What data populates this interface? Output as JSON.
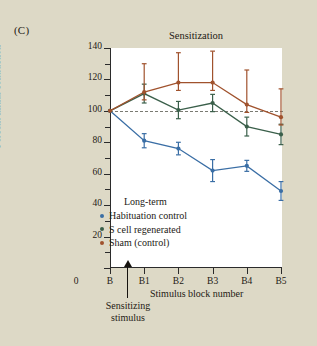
{
  "panel": {
    "label": "(C)"
  },
  "chart_data": {
    "type": "line",
    "title": "Sensitization",
    "xlabel": "Stimulus block number",
    "ylabel": "Percent initial contraction",
    "categories": [
      "B",
      "B1",
      "B2",
      "B3",
      "B4",
      "B5"
    ],
    "x_tick_labels": [
      "0",
      "B",
      "B1",
      "B2",
      "B3",
      "B4",
      "B5"
    ],
    "ylim": [
      0,
      140
    ],
    "y_ticks": [
      0,
      20,
      40,
      60,
      80,
      100,
      120,
      140
    ],
    "y_tick_labels": [
      "",
      "20",
      "40",
      "60",
      "80",
      "100",
      "120",
      "140"
    ],
    "y_minor_ticks": [
      10,
      30,
      50,
      70,
      90,
      110,
      130
    ],
    "grid": false,
    "reference_line": {
      "value": 100,
      "style": "dashed",
      "color": "#7a7a72"
    },
    "legend_position": "lower-left-inside",
    "legend_title": "Long-term",
    "annotation": {
      "text": "Sensitizing stimulus",
      "at_x": "between B and B1"
    },
    "series": [
      {
        "name": "Habituation control",
        "color": "#3a6ea5",
        "values": [
          100,
          81,
          76,
          62,
          65,
          49
        ],
        "err_low": [
          0,
          4.5,
          4,
          7,
          3.5,
          6
        ],
        "err_high": [
          0,
          4.5,
          4,
          7,
          3.5,
          6
        ]
      },
      {
        "name": "S cell regenerated",
        "color": "#3a5f4a",
        "values": [
          100,
          111,
          100.5,
          105,
          90,
          85
        ],
        "err_low": [
          0,
          6,
          5.5,
          5.5,
          6,
          6.5
        ],
        "err_high": [
          0,
          6,
          5.5,
          5.5,
          6,
          6.5
        ]
      },
      {
        "name": "Sham (control)",
        "color": "#a0522d",
        "values": [
          100,
          112,
          118,
          118,
          104,
          96
        ],
        "err_low": [
          0,
          5,
          5,
          5,
          5,
          5
        ],
        "err_high": [
          0,
          18,
          19,
          20,
          22,
          18
        ]
      }
    ]
  }
}
